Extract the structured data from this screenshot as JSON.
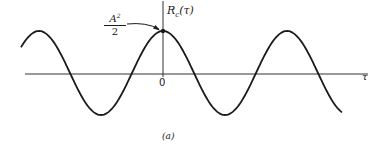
{
  "figure": {
    "caption": "(a)",
    "y_axis_label": "R",
    "y_axis_label_subscript": "c",
    "y_axis_label_arg": "(τ)",
    "x_axis_label": "τ",
    "origin_label": "0",
    "annotation": {
      "numerator_base": "A",
      "numerator_exp": "2",
      "denominator": "2",
      "points_to": "peak at τ = 0"
    },
    "colors": {
      "curve": "#1a1a1a",
      "axis": "#333333",
      "background": "#ffffff"
    }
  },
  "chart_data": {
    "type": "line",
    "title": "",
    "xlabel": "τ",
    "ylabel": "R_c(τ)",
    "function": "(A^2/2) cos(ω0 τ)",
    "annotations": [
      "A^2/2 at τ = 0 (maximum)"
    ],
    "grid": false,
    "x_units": "periods",
    "x": [
      -1.0,
      -0.75,
      -0.5,
      -0.25,
      0,
      0.25,
      0.5,
      0.75,
      1.0,
      1.25,
      1.45
    ],
    "values": [
      1,
      0,
      -1,
      0,
      1,
      0,
      -1,
      0,
      1,
      0,
      -0.8
    ],
    "y_normalized_peak": "A^2/2"
  }
}
